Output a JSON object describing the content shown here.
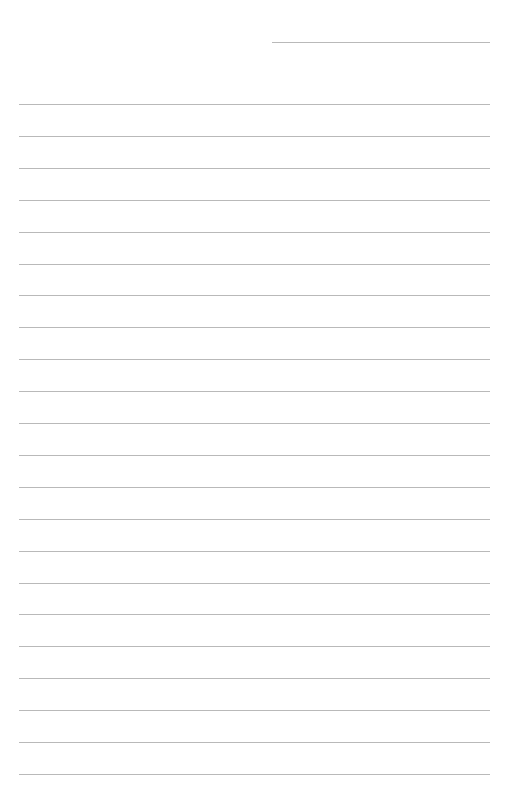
{
  "page": {
    "type": "lined-paper",
    "background_color": "#ffffff",
    "line_color": "#b9b9b9"
  },
  "header_line": {
    "x1": 272,
    "x2": 490,
    "y": 42
  },
  "ruled_lines": {
    "x1": 19,
    "x2": 490,
    "start_y": 104,
    "spacing": 31.9,
    "count": 22
  }
}
